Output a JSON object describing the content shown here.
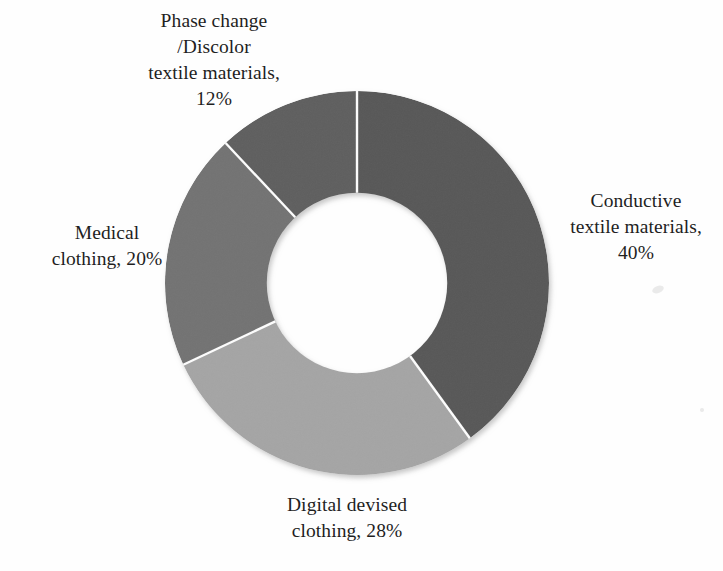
{
  "figure": {
    "background_color": "#ffffff",
    "label_color": "#1f1f1f"
  },
  "chart_data": {
    "type": "pie",
    "variant": "donut",
    "title": "",
    "subtitle": "",
    "xlabel": "",
    "ylabel": "",
    "legend_position": "none",
    "grid": false,
    "units": "%",
    "start_angle_deg": 0,
    "direction": "clockwise",
    "hole_ratio": 0.47,
    "categories": [
      "Conductive textile materials",
      "Digital devised clothing",
      "Medical clothing",
      "Phase change /Discolor textile materials"
    ],
    "values": [
      40,
      28,
      20,
      12
    ],
    "colors": [
      "#595959",
      "#a5a5a5",
      "#737373",
      "#5e5e5e"
    ],
    "slices": [
      {
        "name": "Conductive textile materials",
        "value": 40,
        "value_label": "40%",
        "color": "#595959",
        "start_deg": 0,
        "end_deg": 144
      },
      {
        "name": "Digital devised clothing",
        "value": 28,
        "value_label": "28%",
        "color": "#a5a5a5",
        "start_deg": 144,
        "end_deg": 244.8
      },
      {
        "name": "Medical clothing",
        "value": 20,
        "value_label": "20%",
        "color": "#737373",
        "start_deg": 244.8,
        "end_deg": 316.8
      },
      {
        "name": "Phase change /Discolor textile materials",
        "value": 12,
        "value_label": "12%",
        "color": "#5e5e5e",
        "start_deg": 316.8,
        "end_deg": 360
      }
    ]
  },
  "labels": {
    "phase_change": "Phase change\n/Discolor\ntextile materials,\n12%",
    "conductive": "Conductive\ntextile materials,\n40%",
    "medical": "Medical\nclothing, 20%",
    "digital": "Digital devised\nclothing, 28%"
  }
}
